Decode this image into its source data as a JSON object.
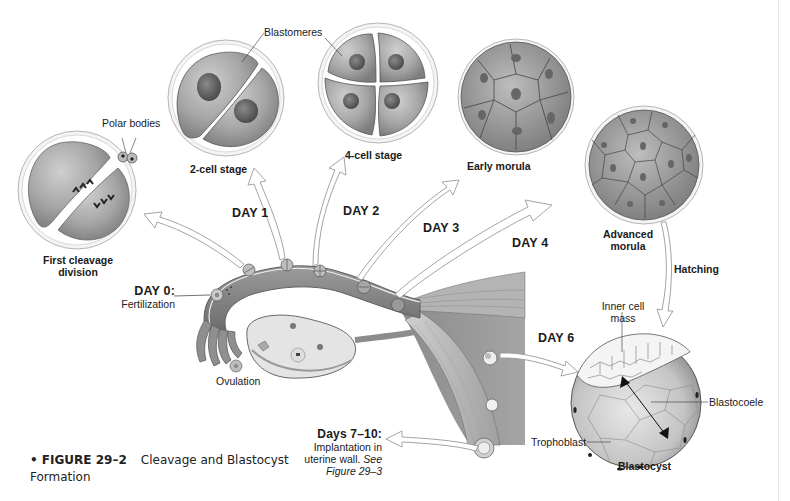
{
  "figure": {
    "number_label": "• FIGURE 29–2",
    "title": "Cleavage and Blastocyst",
    "title_cont": "Formation"
  },
  "stages": {
    "first_cleavage": "First cleavage",
    "first_cleavage_2": "division",
    "polar_bodies": "Polar bodies",
    "two_cell": "2-cell stage",
    "blastomeres": "Blastomeres",
    "four_cell": "4-cell stage",
    "early_morula": "Early morula",
    "advanced_morula": "Advanced",
    "advanced_morula_2": "morula",
    "hatching": "Hatching",
    "blastocyst": "Blastocyst"
  },
  "days": {
    "day0": "DAY 0:",
    "day0_desc": "Fertilization",
    "day1": "DAY 1",
    "day2": "DAY 2",
    "day3": "DAY 3",
    "day4": "DAY 4",
    "day6": "DAY 6",
    "day7_10": "Days 7–10:",
    "day7_10_desc1": "Implantation in",
    "day7_10_desc2": "uterine wall.",
    "day7_10_see": "See",
    "day7_10_ref": "Figure 29–3"
  },
  "anatomy": {
    "ovulation": "Ovulation",
    "inner_cell_mass": "Inner cell",
    "inner_cell_mass_2": "mass",
    "blastocoele": "Blastocoele",
    "trophoblast": "Trophoblast"
  },
  "colors": {
    "cell_fill": "#a9a9a9",
    "cell_dark": "#7a7a7a",
    "nucleus": "#5a5a5a",
    "tube": "#8c8c8c",
    "arrow_stroke": "#9a9a9a",
    "text": "#1a1a1a"
  }
}
